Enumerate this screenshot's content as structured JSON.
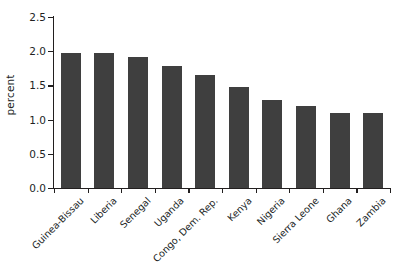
{
  "chart_data": {
    "type": "bar",
    "title": "",
    "xlabel": "",
    "ylabel": "percent",
    "ylim": [
      0,
      2.5
    ],
    "yticks": [
      "0.0",
      "0.5",
      "1.0",
      "1.5",
      "2.0",
      "2.5"
    ],
    "ytick_values": [
      0,
      0.5,
      1,
      1.5,
      2,
      2.5
    ],
    "grid": false,
    "legend": "none",
    "bar_color": "#3f3f3f",
    "background_color": "#ffffff",
    "axis_color": "#221f1f",
    "categories": [
      "Guinea-Bissau",
      "Liberia",
      "Senegal",
      "Uganda",
      "Congo, Dem. Rep.",
      "Kenya",
      "Nigeria",
      "Sierra Leone",
      "Ghana",
      "Zambia"
    ],
    "values": [
      1.98,
      1.98,
      1.92,
      1.78,
      1.65,
      1.48,
      1.28,
      1.2,
      1.1,
      1.1
    ]
  }
}
